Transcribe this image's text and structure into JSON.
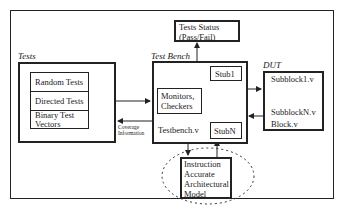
{
  "diagram": {
    "title": "",
    "tests_status": {
      "line1": "Tests Status",
      "line2": "(Pass/Fail)"
    },
    "tests": {
      "label": "Tests",
      "items": [
        "Random Tests",
        "Directed Tests",
        "Binary Test",
        "Vectors"
      ]
    },
    "test_bench": {
      "label": "Test Bench",
      "monitors": {
        "line1": "Monitors,",
        "line2": "Checkers"
      },
      "file": "Testbench.v",
      "stub1": "Stub1",
      "stubn": "StubN"
    },
    "coverage": {
      "line1": "Coverage",
      "line2": "Information"
    },
    "dut": {
      "label": "DUT",
      "items": [
        "Subblock1.v",
        "SubblockN.v",
        "Block.v"
      ]
    },
    "model": {
      "lines": [
        "Instruction",
        "Accurate",
        "Architectural",
        "Model"
      ]
    },
    "colors": {
      "line": "#222222",
      "background": "#ffffff"
    }
  }
}
